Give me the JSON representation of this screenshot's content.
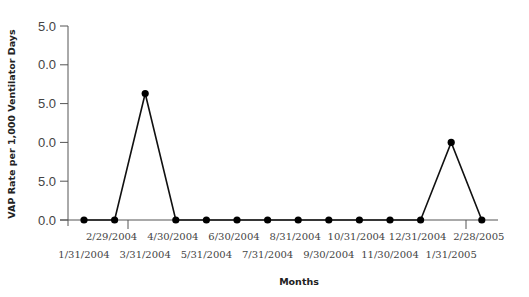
{
  "chart_data": {
    "type": "line",
    "title": "",
    "xlabel": "Months",
    "ylabel": "VAP Rate per 1,000 Ventilator Days",
    "ytick_labels_visible": [
      "5.0",
      "0.0",
      "5.0",
      "0.0",
      "5.0",
      "0.0"
    ],
    "ylim": [
      0,
      25
    ],
    "yticks": [
      25,
      20,
      15,
      10,
      5,
      0
    ],
    "grid": false,
    "legend": null,
    "categories": [
      "1/31/2004",
      "2/29/2004",
      "3/31/2004",
      "4/30/2004",
      "5/31/2004",
      "6/30/2004",
      "7/31/2004",
      "8/31/2004",
      "9/30/2004",
      "10/31/2004",
      "11/30/2004",
      "12/31/2004",
      "1/31/2005",
      "2/28/2005"
    ],
    "series": [
      {
        "name": "VAP Rate",
        "values": [
          0,
          0,
          16.3,
          0,
          0,
          0,
          0,
          0,
          0,
          0,
          0,
          0,
          10.0,
          0
        ]
      }
    ]
  },
  "colors": {
    "line": "#111111",
    "marker": "#000000",
    "axis": "#555555",
    "text": "#444444"
  }
}
